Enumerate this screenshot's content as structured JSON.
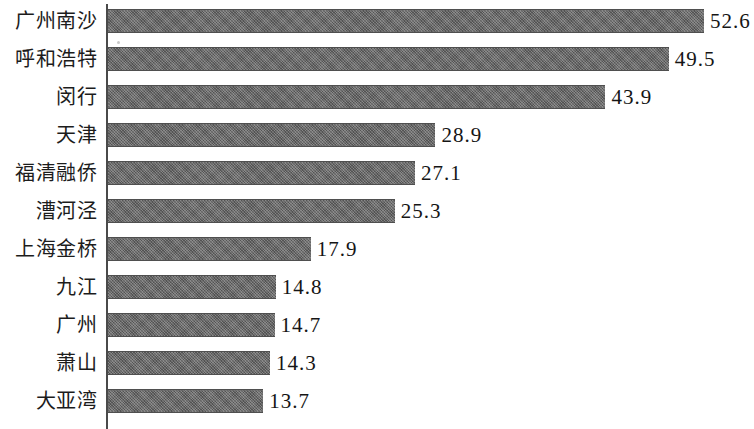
{
  "chart_data": {
    "type": "bar",
    "orientation": "horizontal",
    "title": "",
    "subtitle": "",
    "xlabel": "",
    "ylabel": "",
    "grid": false,
    "legend": false,
    "legend_position": "none",
    "axis_line": "category",
    "xlim": [
      0,
      56
    ],
    "bar_color": "#636363",
    "categories": [
      "广州南沙",
      "呼和浩特",
      "闵行",
      "天津",
      "福清融侨",
      "漕河泾",
      "上海金桥",
      "九江",
      "广州",
      "萧山",
      "大亚湾"
    ],
    "values": [
      52.6,
      49.5,
      43.9,
      28.9,
      27.1,
      25.3,
      17.9,
      14.8,
      14.7,
      14.3,
      13.7
    ],
    "value_labels": [
      "52.6",
      "49.5",
      "43.9",
      "28.9",
      "27.1",
      "25.3",
      "17.9",
      "14.8",
      "14.7",
      "14.3",
      "13.7"
    ],
    "rows": [
      {
        "label": "广州南沙",
        "value": 52.6,
        "value_label": "52.6"
      },
      {
        "label": "呼和浩特",
        "value": 49.5,
        "value_label": "49.5"
      },
      {
        "label": "闵行",
        "value": 43.9,
        "value_label": "43.9"
      },
      {
        "label": "天津",
        "value": 28.9,
        "value_label": "28.9"
      },
      {
        "label": "福清融侨",
        "value": 27.1,
        "value_label": "27.1"
      },
      {
        "label": "漕河泾",
        "value": 25.3,
        "value_label": "25.3"
      },
      {
        "label": "上海金桥",
        "value": 17.9,
        "value_label": "17.9"
      },
      {
        "label": "九江",
        "value": 14.8,
        "value_label": "14.8"
      },
      {
        "label": "广州",
        "value": 14.7,
        "value_label": "14.7"
      },
      {
        "label": "萧山",
        "value": 14.3,
        "value_label": "14.3"
      },
      {
        "label": "大亚湾",
        "value": 13.7,
        "value_label": "13.7"
      }
    ]
  },
  "layout": {
    "axis_x": 108,
    "row_pitch": 38,
    "first_row_top": 2,
    "bar_height": 24,
    "px_per_unit": 11.33,
    "value_label_gap": 6
  }
}
